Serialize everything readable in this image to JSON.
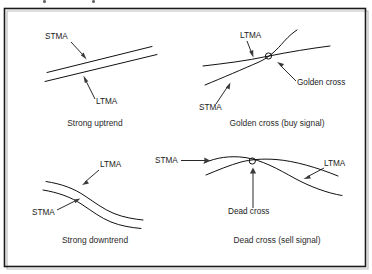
{
  "figure": {
    "frame": {
      "border_color": "#1a1a1a",
      "background": "#ffffff"
    },
    "line_color": "#111111",
    "text_color": "#1a1a1a",
    "panels": [
      {
        "id": "strong-uptrend",
        "caption": "Strong uptrend",
        "labels": [
          {
            "name": "stma",
            "text": "STMA"
          },
          {
            "name": "ltma",
            "text": "LTMA"
          }
        ]
      },
      {
        "id": "golden-cross",
        "caption": "Golden cross (buy signal)",
        "labels": [
          {
            "name": "ltma",
            "text": "LTMA"
          },
          {
            "name": "stma",
            "text": "STMA"
          },
          {
            "name": "cross",
            "text": "Golden cross"
          }
        ]
      },
      {
        "id": "strong-downtrend",
        "caption": "Strong downtrend",
        "labels": [
          {
            "name": "ltma",
            "text": "LTMA"
          },
          {
            "name": "stma",
            "text": "STMA"
          }
        ]
      },
      {
        "id": "dead-cross",
        "caption": "Dead cross (sell signal)",
        "labels": [
          {
            "name": "stma",
            "text": "STMA"
          },
          {
            "name": "ltma",
            "text": "LTMA"
          },
          {
            "name": "cross",
            "text": "Dead cross"
          }
        ]
      }
    ]
  }
}
